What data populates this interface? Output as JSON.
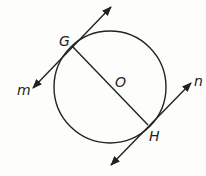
{
  "diagram": {
    "type": "circle with tangent lines",
    "circle": {
      "center_label": "O",
      "cx": 110,
      "cy": 87,
      "r": 56
    },
    "points": [
      {
        "label": "G",
        "x": 72,
        "y": 46
      },
      {
        "label": "H",
        "x": 148,
        "y": 125
      }
    ],
    "segments": [
      {
        "from": "G",
        "to": "H",
        "description": "diameter GH"
      }
    ],
    "lines": [
      {
        "label": "m",
        "tangent_at": "G"
      },
      {
        "label": "n",
        "tangent_at": "H"
      }
    ],
    "labels": {
      "G": "G",
      "H": "H",
      "O": "O",
      "m": "m",
      "n": "n"
    },
    "colors": {
      "stroke": "#222222",
      "background": "#fdfdfb"
    }
  }
}
